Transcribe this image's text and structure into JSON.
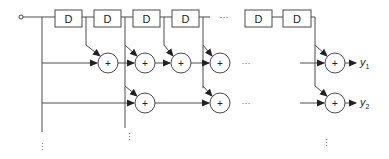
{
  "diagram": {
    "type": "tapped-delay-line filter bank",
    "input": {
      "symbol": "input-terminal"
    },
    "delay_label": "D",
    "delay_count_shown": 6,
    "adder_symbol": "+",
    "horizontal_ellipsis": "···",
    "vertical_ellipsis": "⋮",
    "outputs": [
      {
        "base": "y",
        "sub": "1"
      },
      {
        "base": "y",
        "sub": "2"
      }
    ],
    "colors": {
      "line": "#4a4a4a",
      "text": "#222222",
      "background": "#ffffff"
    }
  }
}
